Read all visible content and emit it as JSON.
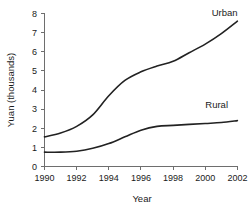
{
  "chart_data": {
    "type": "line",
    "title": "",
    "xlabel": "Year",
    "ylabel": "Yuan (thousands)",
    "xlim": [
      1990,
      2002
    ],
    "ylim": [
      0,
      8
    ],
    "xticks": [
      "1990",
      "1992",
      "1994",
      "1996",
      "1998",
      "2000",
      "2002"
    ],
    "yticks": [
      "0",
      "1",
      "2",
      "3",
      "4",
      "5",
      "6",
      "7",
      "8"
    ],
    "grid": false,
    "legend_position": "inline-right-of-series",
    "x": [
      1990,
      1991,
      1992,
      1993,
      1994,
      1995,
      1996,
      1997,
      1998,
      1999,
      2000,
      2001,
      2002
    ],
    "series": [
      {
        "name": "Urban",
        "label": "Urban",
        "color": "#222222",
        "values": [
          1.55,
          1.75,
          2.1,
          2.7,
          3.7,
          4.5,
          4.95,
          5.25,
          5.5,
          5.95,
          6.4,
          6.95,
          7.6
        ]
      },
      {
        "name": "Rural",
        "label": "Rural",
        "color": "#222222",
        "values": [
          0.75,
          0.75,
          0.8,
          0.95,
          1.2,
          1.55,
          1.9,
          2.1,
          2.15,
          2.2,
          2.25,
          2.3,
          2.4
        ]
      }
    ],
    "annotations": [
      {
        "text": "Urban",
        "x": 2000.4,
        "y": 7.85
      },
      {
        "text": "Rural",
        "x": 2000.0,
        "y": 3.05
      }
    ]
  },
  "axis": {
    "y_title": "Yuan (thousands)",
    "x_title": "Year"
  },
  "colors": {
    "line": "#222222",
    "axis": "#6e6e6e",
    "text": "#1a1a1a",
    "background": "#ffffff"
  }
}
